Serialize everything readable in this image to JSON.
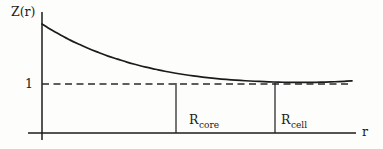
{
  "figure": {
    "type": "line-plot-schematic",
    "background_color": "#fdfdfc",
    "ink_color": "#1b1b1b"
  },
  "axes": {
    "y_axis_label": "Z(r)",
    "x_axis_label": "r",
    "y_tick_label": "1",
    "y_axis_x_px": 42,
    "y_axis_top_px": 12,
    "x_axis_y_px": 133,
    "x_axis_left_px": 28,
    "x_axis_right_px": 356
  },
  "markers": [
    {
      "name": "R_core",
      "base": "R",
      "subscript": "core",
      "x_px": 176
    },
    {
      "name": "R_cell",
      "base": "R",
      "subscript": "cell",
      "x_px": 275
    }
  ],
  "reference_line": {
    "label": "1",
    "style": "dashed",
    "y_px": 84,
    "x_start_px": 42,
    "x_end_px": 352
  },
  "chart_data": {
    "type": "line",
    "title": "",
    "xlabel": "r",
    "ylabel": "Z(r)",
    "grid": false,
    "legend": false,
    "xlim": [
      0,
      1
    ],
    "ylim": [
      1,
      3.6
    ],
    "annotations": [
      {
        "text": "R_core",
        "x": 0.427,
        "y": 0.0,
        "kind": "vertical-marker"
      },
      {
        "text": "R_cell",
        "x": 0.742,
        "y": 0.0,
        "kind": "vertical-marker"
      },
      {
        "text": "1",
        "y": 1.0,
        "kind": "horizontal-dashed-reference"
      }
    ],
    "series": [
      {
        "name": "Z(r)",
        "style": "solid",
        "description": "monotonically decaying curve approaching the asymptote Z = 1 near R_core, flat through R_cell, rising very slightly at the outer edge",
        "x": [
          0.0,
          0.03,
          0.061,
          0.091,
          0.122,
          0.152,
          0.183,
          0.213,
          0.244,
          0.274,
          0.305,
          0.335,
          0.366,
          0.396,
          0.427,
          0.457,
          0.488,
          0.518,
          0.549,
          0.579,
          0.61,
          0.64,
          0.671,
          0.701,
          0.732,
          0.762,
          0.793,
          0.823,
          0.854,
          0.884,
          0.915,
          0.945,
          0.976,
          1.0
        ],
        "y": [
          3.56,
          3.31,
          3.08,
          2.87,
          2.68,
          2.5,
          2.34,
          2.19,
          2.06,
          1.93,
          1.82,
          1.72,
          1.63,
          1.545,
          1.47,
          1.405,
          1.345,
          1.295,
          1.25,
          1.212,
          1.18,
          1.152,
          1.128,
          1.108,
          1.092,
          1.08,
          1.072,
          1.068,
          1.068,
          1.072,
          1.082,
          1.096,
          1.116,
          1.134
        ]
      }
    ]
  }
}
